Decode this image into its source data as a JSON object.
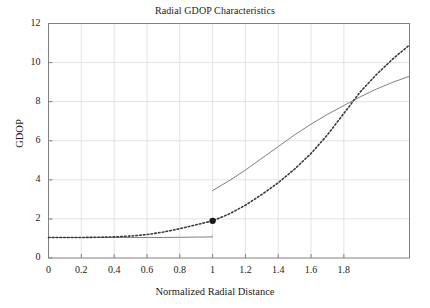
{
  "chart_data": {
    "type": "line",
    "title": "Radial GDOP Characteristics",
    "xlabel": "Normalized Radial Distance",
    "ylabel": "GDOP",
    "xlim": [
      0,
      2.2
    ],
    "ylim": [
      0,
      12
    ],
    "grid": true,
    "legend": "none",
    "xticks": [
      "0",
      "0.2",
      "0.4",
      "0.6",
      "0.8",
      "1",
      "1.2",
      "1.4",
      "1.6",
      "1.8"
    ],
    "xtick_values": [
      0,
      0.2,
      0.4,
      0.6,
      0.8,
      1,
      1.2,
      1.4,
      1.6,
      1.8
    ],
    "yticks": [
      "0",
      "2",
      "4",
      "6",
      "8",
      "10",
      "12"
    ],
    "ytick_values": [
      0,
      2,
      4,
      6,
      8,
      10,
      12
    ],
    "series": [
      {
        "name": "solid-curve",
        "style": "solid",
        "color": "#808080",
        "segments": [
          {
            "name": "interior-flat",
            "x": [
              0,
              0.1,
              0.2,
              0.3,
              0.4,
              0.5,
              0.6,
              0.7,
              0.8,
              0.9,
              1.0
            ],
            "y": [
              1.05,
              1.05,
              1.05,
              1.05,
              1.05,
              1.05,
              1.05,
              1.05,
              1.06,
              1.07,
              1.08
            ]
          },
          {
            "name": "exterior-rise",
            "x": [
              1.0,
              1.1,
              1.2,
              1.3,
              1.4,
              1.5,
              1.6,
              1.7,
              1.8,
              1.9,
              2.0,
              2.1,
              2.2
            ],
            "y": [
              3.45,
              3.95,
              4.5,
              5.1,
              5.7,
              6.3,
              6.85,
              7.35,
              7.8,
              8.25,
              8.65,
              9.0,
              9.3
            ]
          }
        ]
      },
      {
        "name": "dotted-curve",
        "style": "dotted",
        "color": "#3a3a3a",
        "segments": [
          {
            "name": "full-curve",
            "x": [
              0,
              0.1,
              0.2,
              0.3,
              0.4,
              0.5,
              0.6,
              0.7,
              0.8,
              0.9,
              1.0,
              1.1,
              1.2,
              1.3,
              1.4,
              1.5,
              1.6,
              1.7,
              1.8,
              1.9,
              2.0,
              2.1,
              2.2
            ],
            "y": [
              1.05,
              1.05,
              1.05,
              1.06,
              1.08,
              1.12,
              1.2,
              1.33,
              1.5,
              1.7,
              1.9,
              2.25,
              2.7,
              3.25,
              3.85,
              4.55,
              5.35,
              6.3,
              7.4,
              8.5,
              9.4,
              10.2,
              10.9
            ]
          }
        ]
      }
    ],
    "markers": [
      {
        "name": "transition-point",
        "x": 1.0,
        "y": 1.9,
        "shape": "circle",
        "color": "#1a1a1a",
        "size": 5
      }
    ]
  }
}
